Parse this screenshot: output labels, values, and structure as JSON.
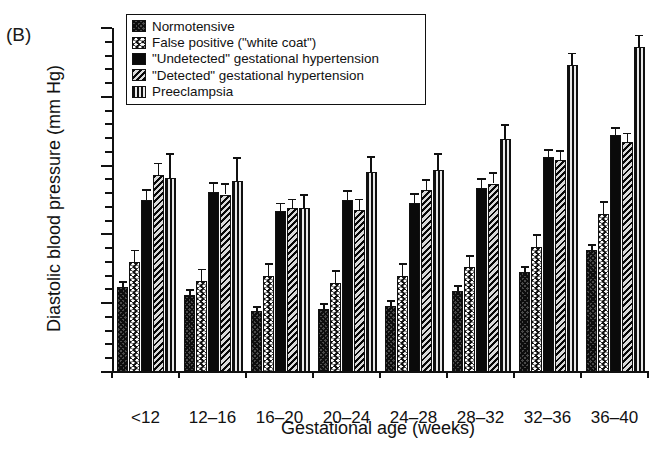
{
  "panel_label": "(B)",
  "legend": {
    "position": "top-center-inside",
    "items": [
      {
        "label": "Normotensive",
        "pattern": "cross-hatch-dark"
      },
      {
        "label": "False positive (\"white coat\")",
        "pattern": "chevron-on-white"
      },
      {
        "label": "\"Undetected\" gestational hypertension",
        "pattern": "solid-black"
      },
      {
        "label": "\"Detected\" gestational hypertension",
        "pattern": "diagonal-hatch"
      },
      {
        "label": "Preeclampsia",
        "pattern": "vertical-stripes"
      }
    ]
  },
  "chart_data": {
    "type": "bar",
    "title": "",
    "xlabel": "Gestational age (weeks)",
    "ylabel": "Diastolic blood pressure (mm Hg)",
    "ylim": [
      55,
      80
    ],
    "yticks": [
      55,
      60,
      65,
      70,
      78,
      80
    ],
    "ytick_labels": [
      "55",
      "60",
      "65",
      "70",
      "78",
      "80"
    ],
    "minor_tick_step": 1,
    "grid": false,
    "units": "mm Hg",
    "categories": [
      "<12",
      "12–16",
      "16–20",
      "20–24",
      "24–28",
      "28–32",
      "32–36",
      "36–40"
    ],
    "series": [
      {
        "name": "Normotensive",
        "values": [
          61.2,
          60.6,
          59.4,
          59.6,
          59.8,
          60.9,
          62.3,
          63.9
        ],
        "errors": [
          0.4,
          0.4,
          0.4,
          0.4,
          0.4,
          0.4,
          0.4,
          0.4
        ]
      },
      {
        "name": "False positive (\"white coat\")",
        "values": [
          63.0,
          61.6,
          62.0,
          61.5,
          62.0,
          62.6,
          64.1,
          66.5
        ],
        "errors": [
          0.9,
          0.9,
          0.9,
          0.9,
          0.9,
          0.9,
          0.9,
          0.9
        ]
      },
      {
        "name": "\"Undetected\" gestational hypertension",
        "values": [
          67.5,
          68.1,
          66.7,
          67.5,
          67.3,
          68.4,
          70.6,
          72.2
        ],
        "errors": [
          0.8,
          0.7,
          0.6,
          0.7,
          0.7,
          0.7,
          0.6,
          0.6
        ]
      },
      {
        "name": "\"Detected\" gestational hypertension",
        "values": [
          69.3,
          67.9,
          66.9,
          66.8,
          68.2,
          68.7,
          70.4,
          71.7
        ],
        "errors": [
          0.9,
          0.8,
          0.7,
          0.8,
          0.8,
          0.8,
          0.7,
          0.7
        ]
      },
      {
        "name": "Preeclampsia",
        "values": [
          69.1,
          68.9,
          66.9,
          69.5,
          69.7,
          71.9,
          77.3,
          78.6
        ],
        "errors": [
          1.8,
          1.7,
          1.0,
          1.2,
          1.2,
          1.1,
          0.9,
          0.9
        ]
      }
    ]
  }
}
